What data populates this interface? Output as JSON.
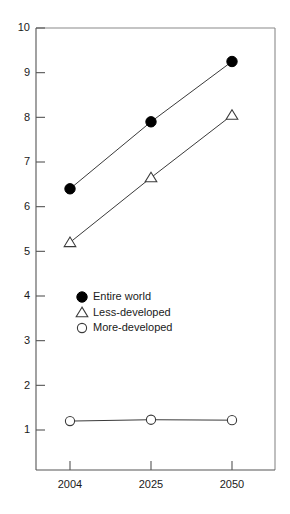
{
  "chart_data": {
    "type": "line",
    "title": "",
    "subtitle": "",
    "xlabel": "",
    "ylabel": "",
    "x": [
      "2004",
      "2025",
      "2050"
    ],
    "categories": [
      "2004",
      "2025",
      "2050"
    ],
    "xtick_labels": [
      "2004",
      "2025",
      "2050"
    ],
    "ytick_labels": [
      "1",
      "2",
      "3",
      "4",
      "5",
      "6",
      "7",
      "8",
      "9",
      "10"
    ],
    "ytick_values": [
      1,
      2,
      3,
      4,
      5,
      6,
      7,
      8,
      9,
      10
    ],
    "ylim": [
      0.55,
      10
    ],
    "grid": false,
    "legend_position": "center-left",
    "series": [
      {
        "name": "Entire world",
        "marker": "filled-circle",
        "values": [
          6.4,
          7.9,
          9.25
        ]
      },
      {
        "name": "Less-developed",
        "marker": "open-triangle",
        "values": [
          5.2,
          6.65,
          8.05
        ]
      },
      {
        "name": "More-developed",
        "marker": "open-circle",
        "values": [
          1.2,
          1.23,
          1.22
        ]
      }
    ],
    "annotations": []
  },
  "legend": {
    "entries": [
      {
        "label": "Entire world",
        "marker": "filled-circle"
      },
      {
        "label": "Less-developed",
        "marker": "open-triangle"
      },
      {
        "label": "More-developed",
        "marker": "open-circle"
      }
    ]
  },
  "colors": {
    "background": "#ffffff",
    "frame": "#8a8a8a",
    "axis": "#555555",
    "line": "#3a3a3a",
    "marker_fill": "#000000",
    "marker_open_fill": "#ffffff",
    "text": "#1a1a1a"
  }
}
